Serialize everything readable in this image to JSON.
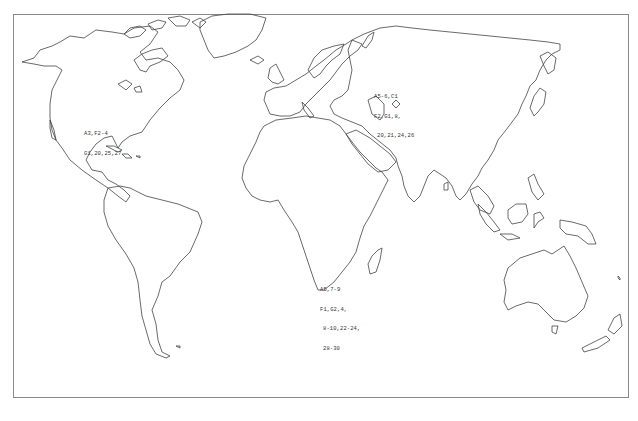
{
  "map": {
    "type": "world-outline-map",
    "projection": "equirectangular-style outline",
    "colors": {
      "background": "#ffffff",
      "coastline": "#444444",
      "frame": "#888888",
      "text": "#333333"
    },
    "annotations": [
      {
        "region": "North America",
        "lines": [
          "A3,F2-4",
          "G1,20,25,27"
        ]
      },
      {
        "region": "Europe",
        "lines": [
          "A5-6,C1",
          "F2,G1,8,",
          "20,21,24,26"
        ]
      },
      {
        "region": "Southern Africa",
        "lines": [
          "A5,7-9",
          "F1,G2,4,",
          "8-10,22-24,",
          "28-30"
        ]
      }
    ]
  }
}
